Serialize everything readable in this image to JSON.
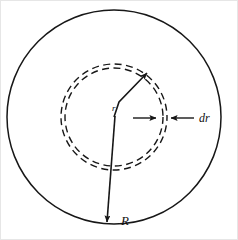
{
  "figure": {
    "background_color": "#ffffff",
    "line_color": "#171717",
    "canvas": {
      "width": 238,
      "height": 240
    },
    "geometry": {
      "center": {
        "x": 114,
        "y": 117
      },
      "outer_circle": {
        "radius": 107,
        "style": "solid"
      },
      "inner_dashed_circles": [
        {
          "radius": 49,
          "style": "dashed"
        },
        {
          "radius": 53,
          "style": "dashed"
        }
      ]
    },
    "labels": {
      "outer_radius": "R",
      "inner_radius": "r",
      "thickness": "dr"
    },
    "annotations": {
      "outer_radius_arrow": {
        "label": "R",
        "from": {
          "x": 114,
          "y": 117
        },
        "to": {
          "x": 106,
          "y": 224
        },
        "label_position": {
          "x": 121,
          "y": 224
        }
      },
      "inner_radius_arrow": {
        "label": "r",
        "from": {
          "x": 114,
          "y": 117
        },
        "to": {
          "x": 150,
          "y": 71
        },
        "label_position": {
          "x": 113,
          "y": 110
        }
      },
      "thickness_dimension": {
        "label": "dr",
        "left_arrow_from": {
          "x": 133,
          "y": 118
        },
        "left_arrow_to": {
          "x": 159,
          "y": 118
        },
        "right_arrow_from": {
          "x": 194,
          "y": 118
        },
        "right_arrow_to": {
          "x": 168,
          "y": 118
        },
        "label_position": {
          "x": 199,
          "y": 122
        }
      }
    }
  }
}
